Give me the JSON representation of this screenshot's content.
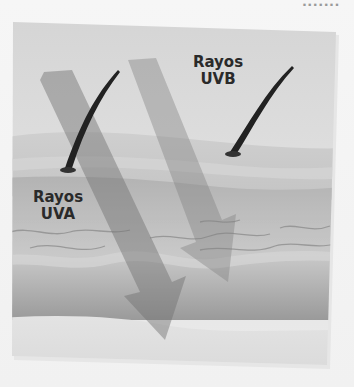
{
  "page": {
    "corner_text": "......."
  },
  "diagram": {
    "labels": {
      "uvb": {
        "line1": "Rayos",
        "line2": "UVB"
      },
      "uva": {
        "line1": "Rayos",
        "line2": "UVA"
      }
    },
    "layers": [
      {
        "name": "sky",
        "color": "#d9d9d9"
      },
      {
        "name": "epidermis",
        "color": "#c9c9c9"
      },
      {
        "name": "dermis",
        "color": "#a9a9a9"
      },
      {
        "name": "hypodermis",
        "color": "#dcdcdc"
      }
    ],
    "arrows": [
      {
        "name": "uva-arrow",
        "color": "#7a7a7a",
        "opacity": 0.55
      },
      {
        "name": "uvb-arrow",
        "color": "#8a8a8a",
        "opacity": 0.45
      }
    ]
  }
}
